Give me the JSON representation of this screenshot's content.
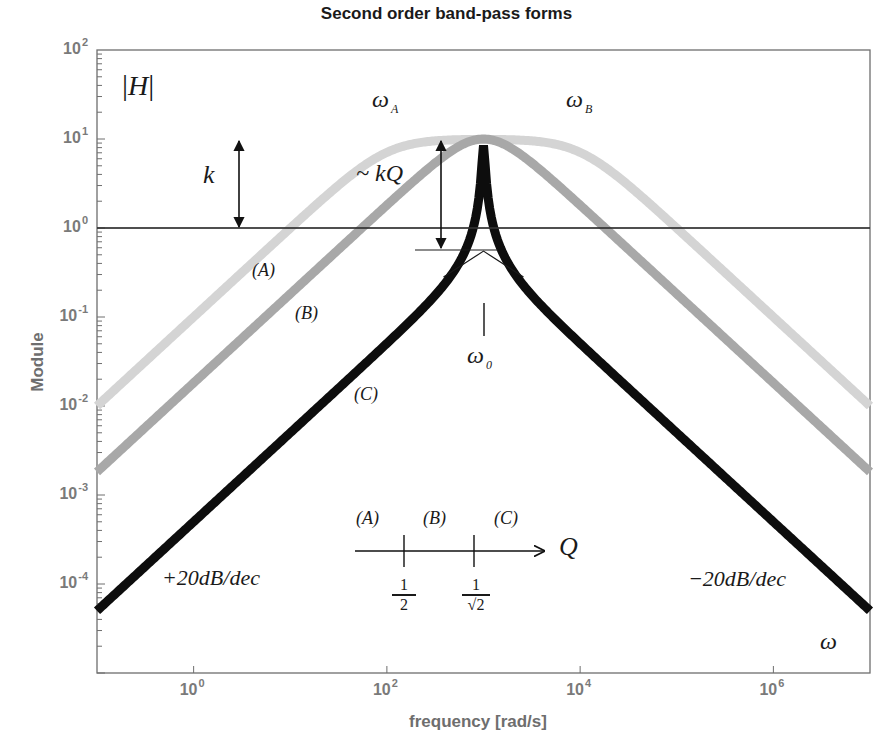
{
  "chart_data": {
    "type": "line",
    "title": "Second order band-pass forms",
    "xlabel": "frequency [rad/s]",
    "ylabel": "Module",
    "xscale": "log",
    "yscale": "log",
    "xlim": [
      0.1,
      10000000
    ],
    "ylim": [
      1e-05,
      100
    ],
    "grid": false,
    "x_ticks": [
      {
        "value": 1,
        "base": "10",
        "exp": "0"
      },
      {
        "value": 100,
        "base": "10",
        "exp": "2"
      },
      {
        "value": 10000,
        "base": "10",
        "exp": "4"
      },
      {
        "value": 1000000,
        "base": "10",
        "exp": "6"
      }
    ],
    "y_ticks": [
      {
        "value": 100,
        "base": "10",
        "exp": "2"
      },
      {
        "value": 10,
        "base": "10",
        "exp": "1"
      },
      {
        "value": 1,
        "base": "10",
        "exp": "0"
      },
      {
        "value": 0.1,
        "base": "10",
        "exp": "-1"
      },
      {
        "value": 0.01,
        "base": "10",
        "exp": "-2"
      },
      {
        "value": 0.001,
        "base": "10",
        "exp": "-3"
      },
      {
        "value": 0.0001,
        "base": "10",
        "exp": "-4"
      }
    ],
    "reference_line": {
      "y": 1,
      "label": "|H| = k"
    },
    "series": [
      {
        "name": "(A)",
        "Q_region": "Q < 1/2",
        "color": "#d4d4d4",
        "width": 9,
        "peak_gain": 10,
        "w_low": 100,
        "w_high": 10000,
        "points": [
          [
            0.1,
            0.01
          ],
          [
            1,
            0.1
          ],
          [
            10,
            1
          ],
          [
            100,
            7.1
          ],
          [
            1000,
            10
          ],
          [
            10000,
            7.1
          ],
          [
            100000,
            1
          ],
          [
            1000000,
            0.1
          ],
          [
            10000000,
            0.01
          ]
        ]
      },
      {
        "name": "(B)",
        "Q_region": "1/2 < Q < 1/sqrt(2)",
        "color": "#a8a8a8",
        "width": 9,
        "peak_gain": 10,
        "w_low": 700,
        "w_high": 1430,
        "points": [
          [
            0.1,
            0.0014
          ],
          [
            1,
            0.014
          ],
          [
            10,
            0.14
          ],
          [
            100,
            1.4
          ],
          [
            1000,
            10
          ],
          [
            10000,
            1.4
          ],
          [
            100000,
            0.14
          ],
          [
            1000000,
            0.014
          ],
          [
            10000000,
            0.0014
          ]
        ]
      },
      {
        "name": "(C)",
        "Q_region": "Q > 1/sqrt(2)",
        "color": "#0d0d0d",
        "width": 9,
        "peak_gain": 8.5,
        "w0": 1000,
        "k": 0.5,
        "Q": 17,
        "points": [
          [
            0.1,
            5e-05
          ],
          [
            1,
            0.0005
          ],
          [
            10,
            0.005
          ],
          [
            100,
            0.05
          ],
          [
            1000,
            8.5
          ],
          [
            10000,
            0.05
          ],
          [
            100000,
            0.005
          ],
          [
            1000000,
            0.0005
          ],
          [
            10000000,
            5e-05
          ]
        ]
      }
    ],
    "annotations": [
      {
        "text": "|H|",
        "x": 0.15,
        "y": 40
      },
      {
        "text": "k",
        "desc": "double arrow from |H|=1 to |H|=10"
      },
      {
        "text": "~kQ",
        "desc": "double arrow from peak to asymptote intersection"
      },
      {
        "text": "ω_A",
        "desc": "lower cutoff of (A)"
      },
      {
        "text": "ω_B",
        "desc": "upper cutoff of (A)"
      },
      {
        "text": "ω_0",
        "x": 1000
      },
      {
        "text": "+20dB/dec",
        "desc": "low-frequency slope"
      },
      {
        "text": "-20dB/dec",
        "desc": "high-frequency slope"
      },
      {
        "text": "ω",
        "desc": "frequency variable"
      }
    ],
    "q_axis": {
      "label": "Q",
      "regions": [
        "(A)",
        "(B)",
        "(C)"
      ],
      "ticks": [
        "1/2",
        "1/√2"
      ]
    }
  },
  "labels": {
    "title": "Second order band-pass forms",
    "xlabel": "frequency [rad/s]",
    "ylabel": "Module",
    "H": "H",
    "k": "k",
    "kQ": "~ kQ",
    "omega": "ω",
    "omega_A_sub": "A",
    "omega_B_sub": "B",
    "omega_0_sub": "0",
    "curve_A": "(A)",
    "curve_B": "(B)",
    "curve_C": "(C)",
    "slope_up": "+20dB/dec",
    "slope_down": "−20dB/dec",
    "Q": "Q",
    "q_A": "(A)",
    "q_B": "(B)",
    "q_C": "(C)",
    "frac1_num": "1",
    "frac1_den": "2",
    "frac2_num": "1",
    "frac2_den": "√2"
  },
  "colors": {
    "axis": "#6e6e6e",
    "curve_A": "#d4d4d4",
    "curve_B": "#a8a8a8",
    "curve_C": "#0d0d0d",
    "ref_line": "#333333"
  }
}
